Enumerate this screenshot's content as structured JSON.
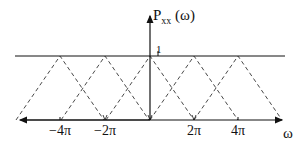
{
  "diagram": {
    "y_axis_label": {
      "main": "P",
      "subscript": "xx",
      "arg": "(ω)"
    },
    "x_axis_label": "ω",
    "level_label": "1",
    "ticks": [
      {
        "label": "−4π",
        "x": 60
      },
      {
        "label": "−2π",
        "x": 105
      },
      {
        "label": "2π",
        "x": 194
      },
      {
        "label": "4π",
        "x": 238
      }
    ],
    "triangle_peaks_x": [
      15,
      60,
      105,
      150,
      194,
      238,
      283
    ],
    "colors": {
      "line": "#111111",
      "dashed": "#333333",
      "background": "#ffffff"
    }
  }
}
